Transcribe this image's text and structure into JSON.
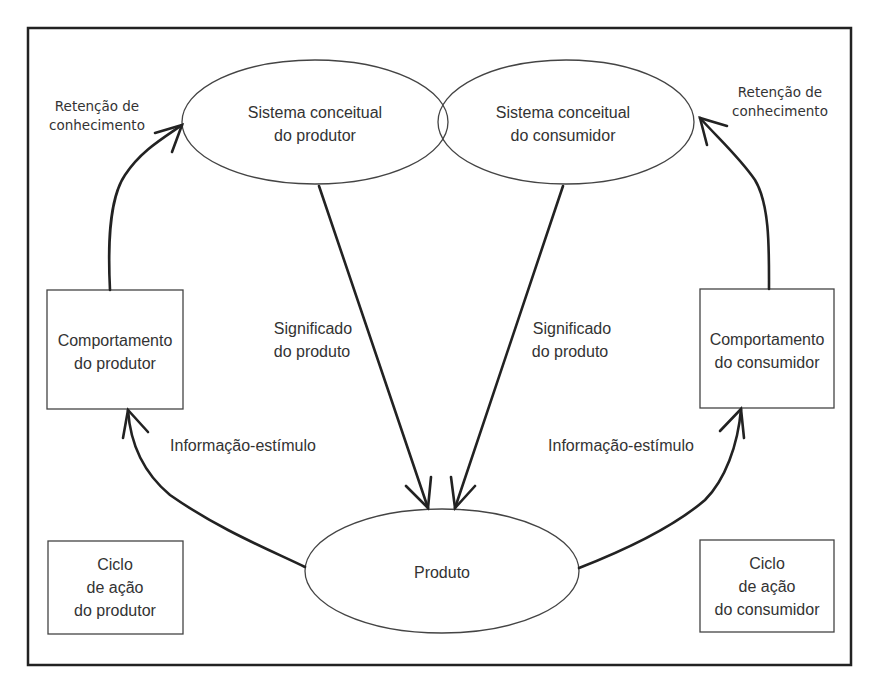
{
  "diagram": {
    "nodes": {
      "producer_concept": {
        "line1": "Sistema conceitual",
        "line2": "do produtor"
      },
      "consumer_concept": {
        "line1": "Sistema conceitual",
        "line2": "do consumidor"
      },
      "producer_behavior": {
        "line1": "Comportamento",
        "line2": "do produtor"
      },
      "consumer_behavior": {
        "line1": "Comportamento",
        "line2": "do consumidor"
      },
      "product": {
        "label": "Produto"
      },
      "producer_cycle": {
        "line1": "Ciclo",
        "line2": "de ação",
        "line3": "do produtor"
      },
      "consumer_cycle": {
        "line1": "Ciclo",
        "line2": "de ação",
        "line3": "do consumidor"
      }
    },
    "edges": {
      "retention_left": {
        "line1": "Retenção de",
        "line2": "conhecimento"
      },
      "retention_right": {
        "line1": "Retenção de",
        "line2": "conhecimento"
      },
      "meaning_left": {
        "line1": "Significado",
        "line2": "do produto"
      },
      "meaning_right": {
        "line1": "Significado",
        "line2": "do produto"
      },
      "stimulus_left": {
        "label": "Informação-estímulo"
      },
      "stimulus_right": {
        "label": "Informação-estímulo"
      }
    }
  }
}
